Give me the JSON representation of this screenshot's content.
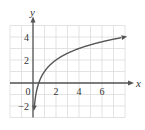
{
  "chart_data": {
    "type": "line",
    "title": "",
    "xlabel": "x",
    "ylabel": "y",
    "xlim": [
      -2,
      8
    ],
    "ylim": [
      -3,
      5
    ],
    "grid": true,
    "x_ticks": [
      {
        "value": 0,
        "label": "0"
      },
      {
        "value": 2,
        "label": "2"
      },
      {
        "value": 4,
        "label": "4"
      },
      {
        "value": 6,
        "label": "6"
      }
    ],
    "y_ticks": [
      {
        "value": 4,
        "label": "4"
      },
      {
        "value": 2,
        "label": "2"
      },
      {
        "value": -2,
        "label": "−2"
      }
    ],
    "series": [
      {
        "name": "curve",
        "color": "#555555",
        "x": [
          0.125,
          0.25,
          0.5,
          1,
          2,
          3,
          4,
          5,
          6,
          7,
          8
        ],
        "y": [
          -2,
          -1,
          0,
          1,
          2,
          2.58,
          3,
          3.32,
          3.58,
          3.81,
          4
        ]
      }
    ],
    "colors": {
      "grid": "#dcdcdc",
      "axis": "#555555",
      "curve": "#555555",
      "background": "#ffffff"
    }
  }
}
